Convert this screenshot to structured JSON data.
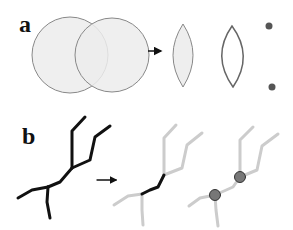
{
  "panels": {
    "a": {
      "label": "a",
      "description": "Two overlapping circles, arrow, filled intersection lens, outlined lens boundary, two intersection points",
      "colors": {
        "circle_fill": "#ececec",
        "circle_stroke": "#888888",
        "lens_stroke": "#777777",
        "point_fill": "#555555",
        "arrow": "#111111"
      }
    },
    "b": {
      "label": "b",
      "description": "Black branching tree, arrow, gray tree with highlighted internal edge, gray tree with two junction nodes",
      "colors": {
        "tree_black": "#111111",
        "tree_gray": "#cccccc",
        "highlight": "#111111",
        "node_fill": "#777777",
        "node_stroke": "#333333",
        "arrow": "#111111"
      }
    }
  }
}
